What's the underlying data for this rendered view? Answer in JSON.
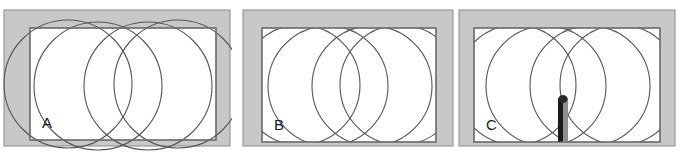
{
  "figure": {
    "background_color": "#ffffff",
    "wall_fill_color": "#c8c8c8",
    "wall_stroke_color": "#8a8a8a",
    "room_fill_color": "#ffffff",
    "room_stroke_color": "#6e6e6e",
    "circle_stroke_color": "#555555",
    "person_dark_color": "#1a1a1a",
    "person_light_color": "#9a9a9a",
    "panel_count": 3,
    "circles_per_panel": 4
  },
  "panels": [
    {
      "id": "panel-a",
      "label": "A",
      "label_x": 26,
      "label_y": 128,
      "caption": "Circles extend beyond the room boundary",
      "outer": {
        "x": 2,
        "y": 10,
        "width": 226,
        "height": 136
      },
      "wall_thickness": {
        "top": 18,
        "left": 18,
        "right": 12,
        "bottom": 6
      },
      "room": {
        "x": 28,
        "y": 28,
        "width": 186,
        "height": 112
      },
      "circles": [
        {
          "cx": 66,
          "cy": 84,
          "r": 64,
          "name": "circle-left-lower"
        },
        {
          "cx": 96,
          "cy": 86,
          "r": 64,
          "name": "circle-left-upper"
        },
        {
          "cx": 146,
          "cy": 86,
          "r": 64,
          "name": "circle-right-upper"
        },
        {
          "cx": 176,
          "cy": 84,
          "r": 64,
          "name": "circle-right-lower"
        }
      ],
      "has_person": false
    },
    {
      "id": "panel-b",
      "label": "B",
      "label_x": 31,
      "label_y": 128,
      "caption": "Circles clipped to the room boundary",
      "outer": {
        "x": 1,
        "y": 10,
        "width": 210,
        "height": 136
      },
      "wall_thickness": {
        "top": 18,
        "left": 18,
        "right": 18,
        "bottom": 4
      },
      "room": {
        "x": 20,
        "y": 28,
        "width": 174,
        "height": 114
      },
      "circles": [
        {
          "cx": 58,
          "cy": 85,
          "r": 60,
          "name": "circle-left-lower"
        },
        {
          "cx": 86,
          "cy": 86,
          "r": 60,
          "name": "circle-left-upper"
        },
        {
          "cx": 130,
          "cy": 86,
          "r": 60,
          "name": "circle-right-upper"
        },
        {
          "cx": 158,
          "cy": 85,
          "r": 60,
          "name": "circle-right-lower"
        }
      ],
      "has_person": false
    },
    {
      "id": "panel-c",
      "label": "C",
      "label_x": 29,
      "label_y": 129,
      "caption": "Circles clipped to the room with a person at the lower centre",
      "outer": {
        "x": 1,
        "y": 10,
        "width": 216,
        "height": 136
      },
      "wall_thickness": {
        "top": 18,
        "left": 14,
        "right": 14,
        "bottom": 4
      },
      "room": {
        "x": 16,
        "y": 28,
        "width": 186,
        "height": 114
      },
      "circles": [
        {
          "cx": 58,
          "cy": 85,
          "r": 60,
          "name": "circle-left-lower"
        },
        {
          "cx": 88,
          "cy": 86,
          "r": 60,
          "name": "circle-left-upper"
        },
        {
          "cx": 132,
          "cy": 86,
          "r": 60,
          "name": "circle-right-upper"
        },
        {
          "cx": 162,
          "cy": 85,
          "r": 60,
          "name": "circle-right-lower"
        }
      ],
      "has_person": true,
      "person": {
        "x": 100,
        "y": 96,
        "width": 10,
        "height": 46
      }
    }
  ],
  "panel_positions": [
    {
      "id": "panel-a",
      "left": 2,
      "width": 230
    },
    {
      "id": "panel-b",
      "left": 242,
      "width": 214
    },
    {
      "id": "panel-c",
      "left": 458,
      "width": 220
    }
  ]
}
